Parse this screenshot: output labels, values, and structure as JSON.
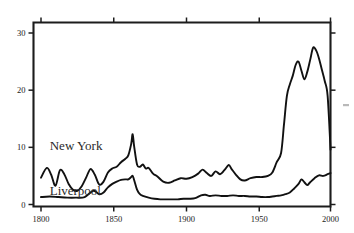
{
  "figure": {
    "title": "",
    "background_color": "#ffffff",
    "ink_color": "#111111"
  },
  "labels": {
    "new_york": "New York",
    "liverpool": "Liverpool"
  },
  "axes": {
    "x_ticks": [
      "1800",
      "1850",
      "1900",
      "1950",
      "2000"
    ],
    "y_ticks": [
      "0",
      "10",
      "20",
      "30"
    ],
    "x_label": "",
    "y_label": ""
  },
  "chart_data": {
    "type": "line",
    "title": "",
    "subtitle": "",
    "xlabel": "",
    "ylabel": "",
    "xlim": [
      1800,
      2000
    ],
    "ylim": [
      0,
      32
    ],
    "xticks": [
      1800,
      1850,
      1900,
      1950,
      2000
    ],
    "yticks": [
      0,
      10,
      20,
      30
    ],
    "grid": false,
    "legend": "inline-labels",
    "legend_position": "inside-left",
    "annotations": [
      {
        "text": "New York",
        "x": 1806,
        "y": 9.6
      },
      {
        "text": "Liverpool",
        "x": 1806,
        "y": 1.6
      }
    ],
    "series": [
      {
        "name": "New York",
        "x": [
          1800,
          1804,
          1807,
          1810,
          1813,
          1816,
          1819,
          1822,
          1825,
          1828,
          1831,
          1834,
          1837,
          1840,
          1843,
          1846,
          1849,
          1852,
          1855,
          1858,
          1860,
          1862,
          1863,
          1864,
          1866,
          1868,
          1870,
          1872,
          1874,
          1877,
          1880,
          1884,
          1888,
          1892,
          1896,
          1900,
          1904,
          1908,
          1911,
          1914,
          1917,
          1920,
          1923,
          1926,
          1929,
          1931,
          1934,
          1937,
          1940,
          1944,
          1948,
          1952,
          1956,
          1959,
          1962,
          1965,
          1967,
          1969,
          1971,
          1973,
          1975,
          1977,
          1979,
          1981,
          1983,
          1985,
          1987,
          1989,
          1991,
          1993,
          1995,
          1997,
          1999
        ],
        "y": [
          4.7,
          6.4,
          5.2,
          3.3,
          6.0,
          5.3,
          3.6,
          2.6,
          2.4,
          3.2,
          4.7,
          6.2,
          5.2,
          3.5,
          4.0,
          5.6,
          6.3,
          6.6,
          7.4,
          8.0,
          8.6,
          10.6,
          12.3,
          10.2,
          7.0,
          6.6,
          7.0,
          6.3,
          6.4,
          5.4,
          4.9,
          4.0,
          3.8,
          4.2,
          4.6,
          4.5,
          4.8,
          5.4,
          6.1,
          5.5,
          5.0,
          5.8,
          5.3,
          6.0,
          6.9,
          6.2,
          5.2,
          4.4,
          4.2,
          4.6,
          4.8,
          4.8,
          5.0,
          5.6,
          7.4,
          9.0,
          14.0,
          19.0,
          21.0,
          22.5,
          24.4,
          25.0,
          23.4,
          21.9,
          23.2,
          25.3,
          27.4,
          27.0,
          25.6,
          23.6,
          21.6,
          19.0,
          9.6
        ],
        "units": "index"
      },
      {
        "name": "Liverpool",
        "x": [
          1800,
          1806,
          1812,
          1818,
          1824,
          1830,
          1836,
          1840,
          1843,
          1846,
          1849,
          1852,
          1855,
          1858,
          1860,
          1862,
          1863,
          1864,
          1866,
          1868,
          1870,
          1874,
          1878,
          1882,
          1886,
          1890,
          1894,
          1898,
          1902,
          1906,
          1910,
          1913,
          1916,
          1920,
          1924,
          1928,
          1932,
          1936,
          1940,
          1944,
          1948,
          1952,
          1956,
          1959,
          1962,
          1965,
          1968,
          1971,
          1974,
          1977,
          1979,
          1981,
          1983,
          1985,
          1988,
          1991,
          1994,
          1997,
          1999
        ],
        "y": [
          1.3,
          1.4,
          1.3,
          1.2,
          1.2,
          1.3,
          2.4,
          1.8,
          2.1,
          3.0,
          3.6,
          4.0,
          4.3,
          4.4,
          4.4,
          4.8,
          5.0,
          4.3,
          2.6,
          1.8,
          1.5,
          1.2,
          1.0,
          0.9,
          0.9,
          0.9,
          0.9,
          1.0,
          1.0,
          1.1,
          1.6,
          1.7,
          1.5,
          1.6,
          1.5,
          1.5,
          1.6,
          1.5,
          1.5,
          1.4,
          1.4,
          1.3,
          1.3,
          1.4,
          1.5,
          1.6,
          1.8,
          2.1,
          2.8,
          3.6,
          4.4,
          3.9,
          3.4,
          3.9,
          4.6,
          5.1,
          5.0,
          5.3,
          5.5
        ],
        "units": "index"
      }
    ]
  }
}
